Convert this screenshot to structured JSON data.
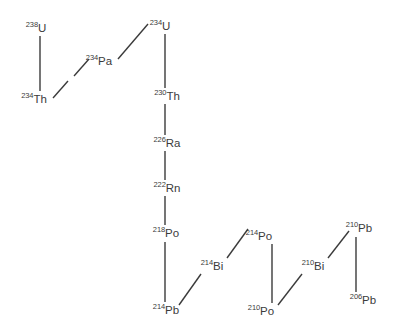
{
  "diagram": {
    "type": "decay-chain",
    "stroke_color": "#3b3b3b",
    "background_color": "#ffffff",
    "nuclides": [
      {
        "id": "u238",
        "mass": "238",
        "symbol": "U",
        "label": "238U",
        "x": 36,
        "y": 28
      },
      {
        "id": "th234",
        "mass": "234",
        "symbol": "Th",
        "label": "234Th",
        "x": 34,
        "y": 99
      },
      {
        "id": "pa234",
        "mass": "234",
        "symbol": "Pa",
        "label": "234Pa",
        "x": 99,
        "y": 61
      },
      {
        "id": "u234",
        "mass": "234",
        "symbol": "U",
        "label": "234U",
        "x": 160,
        "y": 26
      },
      {
        "id": "th230",
        "mass": "230",
        "symbol": "Th",
        "label": "230Th",
        "x": 167,
        "y": 96
      },
      {
        "id": "ra226",
        "mass": "226",
        "symbol": "Ra",
        "label": "226Ra",
        "x": 167,
        "y": 143
      },
      {
        "id": "rn222",
        "mass": "222",
        "symbol": "Rn",
        "label": "222Rn",
        "x": 167,
        "y": 188
      },
      {
        "id": "po218",
        "mass": "218",
        "symbol": "Po",
        "label": "218Po",
        "x": 166,
        "y": 233
      },
      {
        "id": "pb214",
        "mass": "214",
        "symbol": "Pb",
        "label": "214Pb",
        "x": 166,
        "y": 310
      },
      {
        "id": "bi214",
        "mass": "214",
        "symbol": "Bi",
        "label": "214Bi",
        "x": 212,
        "y": 266
      },
      {
        "id": "po214",
        "mass": "214",
        "symbol": "Po",
        "label": "214Po",
        "x": 259,
        "y": 236
      },
      {
        "id": "po210",
        "mass": "210",
        "symbol": "Po",
        "label": "210Po",
        "x": 261,
        "y": 311
      },
      {
        "id": "bi210",
        "mass": "210",
        "symbol": "Bi",
        "label": "210Bi",
        "x": 313,
        "y": 266
      },
      {
        "id": "pb210",
        "mass": "210",
        "symbol": "Pb",
        "label": "210Pb",
        "x": 359,
        "y": 228
      },
      {
        "id": "pb206",
        "mass": "206",
        "symbol": "Pb",
        "label": "206Pb",
        "x": 363,
        "y": 300
      }
    ],
    "decay_links": [
      {
        "id": "u238-th234",
        "from": "u238",
        "to": "th234",
        "x1": 40,
        "y1": 36,
        "x2": 40,
        "y2": 91
      },
      {
        "id": "th234-pa234a",
        "from": "th234",
        "to": "pa234",
        "x1": 53,
        "y1": 98,
        "x2": 68,
        "y2": 81
      },
      {
        "id": "th234-pa234b",
        "from": "th234",
        "to": "pa234",
        "x1": 74,
        "y1": 76,
        "x2": 89,
        "y2": 59
      },
      {
        "id": "pa234-u234",
        "from": "pa234",
        "to": "u234",
        "x1": 118,
        "y1": 59,
        "x2": 148,
        "y2": 24
      },
      {
        "id": "u234-th230",
        "from": "u234",
        "to": "th230",
        "x1": 165,
        "y1": 34,
        "x2": 165,
        "y2": 88
      },
      {
        "id": "th230-ra226",
        "from": "th230",
        "to": "ra226",
        "x1": 165,
        "y1": 104,
        "x2": 165,
        "y2": 135
      },
      {
        "id": "ra226-rn222",
        "from": "ra226",
        "to": "rn222",
        "x1": 165,
        "y1": 151,
        "x2": 165,
        "y2": 180
      },
      {
        "id": "rn222-po218",
        "from": "rn222",
        "to": "po218",
        "x1": 165,
        "y1": 196,
        "x2": 165,
        "y2": 225
      },
      {
        "id": "po218-pb214",
        "from": "po218",
        "to": "pb214",
        "x1": 165,
        "y1": 242,
        "x2": 165,
        "y2": 302
      },
      {
        "id": "pb214-bi214",
        "from": "pb214",
        "to": "bi214",
        "x1": 179,
        "y1": 305,
        "x2": 201,
        "y2": 274
      },
      {
        "id": "bi214-po214",
        "from": "bi214",
        "to": "po214",
        "x1": 227,
        "y1": 258,
        "x2": 248,
        "y2": 229
      },
      {
        "id": "po214-po210",
        "from": "po214",
        "to": "po210",
        "x1": 272,
        "y1": 244,
        "x2": 272,
        "y2": 303
      },
      {
        "id": "po210-bi210",
        "from": "po210",
        "to": "bi210",
        "x1": 278,
        "y1": 305,
        "x2": 302,
        "y2": 274
      },
      {
        "id": "bi210-pb210",
        "from": "bi210",
        "to": "pb210",
        "x1": 328,
        "y1": 258,
        "x2": 349,
        "y2": 231
      },
      {
        "id": "pb210-pb206",
        "from": "pb210",
        "to": "pb206",
        "x1": 356,
        "y1": 237,
        "x2": 356,
        "y2": 292
      }
    ]
  }
}
